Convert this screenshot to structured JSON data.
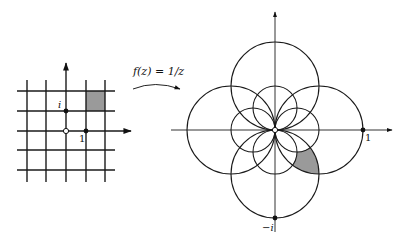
{
  "mapping": {
    "label": "f(z) = 1/z",
    "function": "1/z"
  },
  "left_plane": {
    "origin_px": [
      66,
      131
    ],
    "unit_px": 20,
    "grid_values": [
      -2,
      -1,
      0,
      1,
      2
    ],
    "labels": {
      "i": "i",
      "one": "1"
    },
    "shaded_square": {
      "x": [
        1,
        2
      ],
      "y": [
        1,
        2
      ]
    },
    "points": [
      {
        "name": "i",
        "x": 0,
        "y": 1,
        "filled": true
      },
      {
        "name": "1",
        "x": 1,
        "y": 0,
        "filled": true
      },
      {
        "name": "origin",
        "x": 0,
        "y": 0,
        "filled": false
      }
    ]
  },
  "right_plane": {
    "origin_px": [
      275,
      130
    ],
    "unit_px": 88,
    "labels": {
      "one": "1",
      "minus_i": "−i"
    },
    "circles_from_lines": [
      {
        "line": "x=1",
        "center": [
          0.5,
          0
        ],
        "r": 0.5
      },
      {
        "line": "x=-1",
        "center": [
          -0.5,
          0
        ],
        "r": 0.5
      },
      {
        "line": "y=1",
        "center": [
          0,
          -0.5
        ],
        "r": 0.5
      },
      {
        "line": "y=-1",
        "center": [
          0,
          0.5
        ],
        "r": 0.5
      },
      {
        "line": "x=2",
        "center": [
          0.25,
          0
        ],
        "r": 0.25
      },
      {
        "line": "x=-2",
        "center": [
          -0.25,
          0
        ],
        "r": 0.25
      },
      {
        "line": "y=2",
        "center": [
          0,
          -0.25
        ],
        "r": 0.25
      },
      {
        "line": "y=-2",
        "center": [
          0,
          0.25
        ],
        "r": 0.25
      }
    ],
    "points": [
      {
        "name": "1",
        "x": 1,
        "y": 0,
        "filled": true
      },
      {
        "name": "-i",
        "x": 0,
        "y": -1,
        "filled": true
      },
      {
        "name": "origin",
        "x": 0,
        "y": 0,
        "filled": false
      }
    ],
    "shaded_region": "image of square [1,2]x[1,2] under 1/z"
  },
  "colors": {
    "line": "#1a1a1a",
    "axis": "#333333",
    "shade": "#9a9a9a",
    "background": "#ffffff"
  }
}
